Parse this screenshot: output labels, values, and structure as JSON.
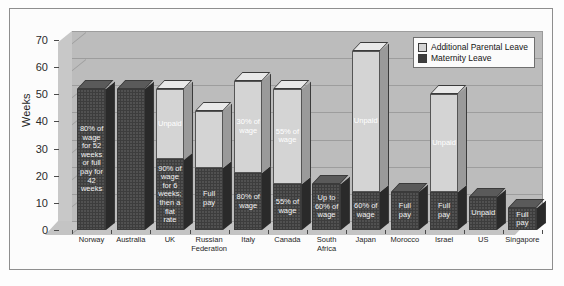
{
  "chart_data": {
    "type": "bar",
    "subtype": "stacked-column-3d",
    "title": "",
    "xlabel": "",
    "ylabel": "Weeks",
    "ylim": [
      0,
      70
    ],
    "ytick_step": 10,
    "yticks": [
      0,
      10,
      20,
      30,
      40,
      50,
      60,
      70
    ],
    "grid": true,
    "legend_position": "top-right",
    "categories": [
      "Norway",
      "Australia",
      "UK",
      "Russian Federation",
      "Italy",
      "Canada",
      "South Africa",
      "Japan",
      "Morocco",
      "Israel",
      "US",
      "Singapore"
    ],
    "series": [
      {
        "name": "Maternity Leave",
        "color": "#3d3d3d",
        "values": [
          52,
          52,
          26,
          23,
          21,
          17,
          17,
          14,
          14,
          14,
          12,
          8
        ],
        "labels": [
          "80% of wage for 52 weeks or full pay for 42 weeks",
          "",
          "90% of wage for 6 weeks; then a flat rate",
          "Full pay",
          "80% of wage",
          "55% of wage",
          "Up to 60% of wage",
          "60% of wage",
          "Full pay",
          "Full pay",
          "Unpaid",
          "Full pay"
        ]
      },
      {
        "name": "Additional Parental Leave",
        "color": "#d4d4d4",
        "values": [
          0,
          0,
          26,
          21,
          34,
          35,
          0,
          52,
          0,
          36,
          0,
          0
        ],
        "labels": [
          "",
          "Unpaid",
          "Unpaid",
          "",
          "30% of wage",
          "55% of wage",
          "",
          "Unpaid",
          "",
          "Unpaid",
          "",
          ""
        ]
      }
    ],
    "totals": [
      52,
      52,
      52,
      44,
      55,
      52,
      17,
      66,
      14,
      50,
      12,
      8
    ]
  },
  "legend": {
    "items": [
      {
        "label": "Additional Parental Leave",
        "swatch": "#d4d4d4"
      },
      {
        "label": "Maternity Leave",
        "swatch": "#3d3d3d"
      }
    ]
  },
  "axis": {
    "y_title": "Weeks"
  }
}
